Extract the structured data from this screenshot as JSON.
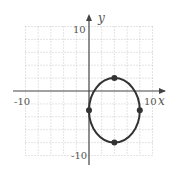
{
  "chart_data": {
    "type": "scatter",
    "title": "",
    "xlabel": "x",
    "ylabel": "y",
    "xlim": [
      -10,
      10
    ],
    "ylim": [
      -10,
      10
    ],
    "grid": true,
    "grid_step": 2,
    "tick_labels": {
      "x": [
        "-10",
        "10"
      ],
      "y": [
        "10",
        "-10"
      ]
    },
    "curve": {
      "shape": "ellipse",
      "center": [
        4,
        -3
      ],
      "radius_x": 4,
      "radius_y": 5,
      "color": "#333333"
    },
    "points": [
      {
        "x": 4,
        "y": 2
      },
      {
        "x": 4,
        "y": -8
      },
      {
        "x": 0,
        "y": -3
      },
      {
        "x": 8,
        "y": -3
      }
    ]
  },
  "labels": {
    "x_axis": "x",
    "y_axis": "y",
    "x_min": "-10",
    "x_max": "10",
    "y_max": "10",
    "y_min": "-10"
  }
}
